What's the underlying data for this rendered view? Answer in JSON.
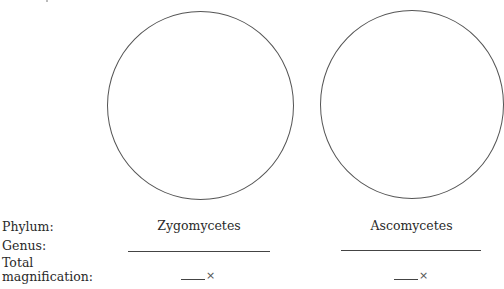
{
  "labels": {
    "phylum": "Phylum:",
    "genus": "Genus:",
    "total_magnification": "Total magnification:"
  },
  "columns": [
    {
      "phylum": "Zygomycetes",
      "genus_value": "",
      "magnification_value": "",
      "magnification_suffix": "×"
    },
    {
      "phylum": "Ascomycetes",
      "genus_value": "",
      "magnification_value": "",
      "magnification_suffix": "×"
    }
  ],
  "colors": {
    "circle_stroke": "#555555",
    "text": "#2a2a2a",
    "lines": "#444444"
  }
}
